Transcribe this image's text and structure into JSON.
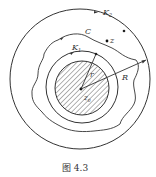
{
  "figure": {
    "caption": "图 4.3",
    "labels": {
      "outer_circle": "K",
      "outer_circle_sub": "2",
      "curve": "C",
      "inner_circle": "K",
      "inner_circle_sub": "1",
      "point": "z",
      "center": "z",
      "center_sub": "0",
      "small_radius": "r",
      "large_radius": "R"
    },
    "colors": {
      "stroke": "#333333",
      "background": "#ffffff"
    }
  }
}
